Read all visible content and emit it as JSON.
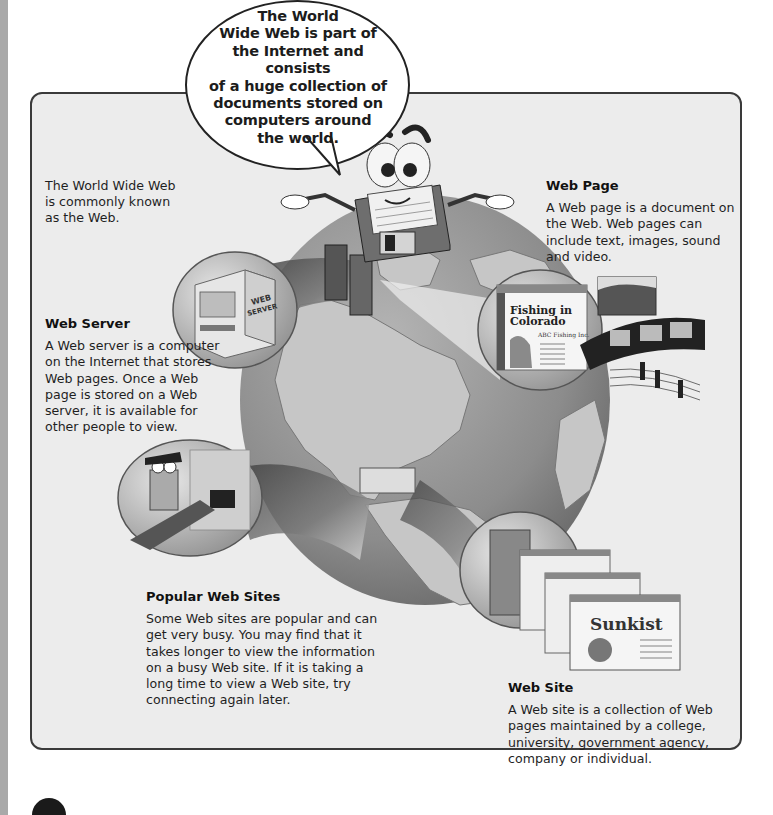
{
  "speech_bubble": {
    "lines": [
      "The World",
      "Wide Web is part of",
      "the Internet and consists",
      "of a huge collection of",
      "documents stored on",
      "computers around",
      "the world."
    ]
  },
  "intro": {
    "text": "The World Wide Web is commonly known as the Web."
  },
  "sections": {
    "web_page": {
      "heading": "Web Page",
      "body": "A Web page is a document on the Web. Web pages can include text, images, sound and video."
    },
    "web_server": {
      "heading": "Web Server",
      "body": "A Web server is a computer on the Internet that stores Web pages. Once a Web page is stored on a Web server, it is available for other people to view."
    },
    "popular_web_sites": {
      "heading": "Popular Web Sites",
      "body": "Some Web sites are popular and can get very busy. You may find that it takes longer to view the information on a busy Web site. If it is taking a long time to view a Web site, try connecting again later."
    },
    "web_site": {
      "heading": "Web Site",
      "body": "A Web site is a collection of Web pages maintained by a college, university, government agency, company or individual."
    }
  },
  "illustration": {
    "server_label": "WEB SERVER",
    "web_page_mock": {
      "title": "Fishing in Colorado",
      "company": "ABC Fishing Inc.",
      "links": [
        "Where to Fish",
        "Guides",
        "Fishing Supplies",
        "Other Great Links",
        "Send Feedback Now"
      ]
    },
    "web_site_mock": {
      "title": "Sunkist",
      "links": [
        "Welcome to Sunkist",
        "In The Kitchen",
        "What's New?",
        "Just Kids",
        "Fresh Ideas",
        "Sunkist's Corner",
        "Industrial Products"
      ]
    }
  },
  "colors": {
    "panel_bg": "#ececec",
    "panel_border": "#3a3a3a",
    "globe": "#9a9a9a",
    "land": "#c8c8c8"
  }
}
